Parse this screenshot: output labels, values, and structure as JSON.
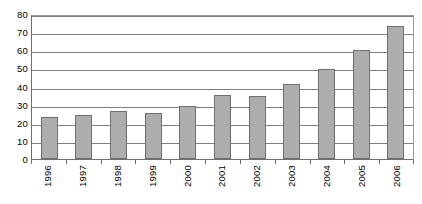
{
  "chart_data": {
    "type": "bar",
    "title": "",
    "subtitle": "",
    "xlabel": "",
    "ylabel": "",
    "categories": [
      "1996",
      "1997",
      "1998",
      "1999",
      "2000",
      "2001",
      "2002",
      "2003",
      "2004",
      "2005",
      "2006"
    ],
    "values": [
      23,
      24.5,
      26.5,
      25.5,
      29.5,
      35.5,
      34.5,
      41.5,
      49.5,
      60,
      73.5
    ],
    "series": [
      {
        "name": "",
        "values": [
          23,
          24.5,
          26.5,
          25.5,
          29.5,
          35.5,
          34.5,
          41.5,
          49.5,
          60,
          73.5
        ]
      }
    ],
    "ylim": [
      0,
      80
    ],
    "ytick_step": 10,
    "yticks": [
      "0",
      "10",
      "20",
      "30",
      "40",
      "50",
      "60",
      "70",
      "80"
    ],
    "xtick_labels_rotation": -90,
    "grid": "horizontal",
    "legend": "none",
    "colors": {
      "bar_fill": "#adadad",
      "bar_border": "#707070",
      "gridline": "#808080",
      "axis": "#6f6f6f",
      "background": "#ffffff",
      "text": "#000000"
    }
  }
}
